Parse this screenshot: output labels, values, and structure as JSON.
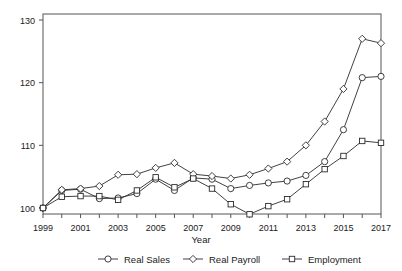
{
  "chart_data": {
    "type": "line",
    "title": "",
    "xlabel": "Year",
    "ylabel": "",
    "x": [
      1999,
      2000,
      2001,
      2002,
      2003,
      2004,
      2005,
      2006,
      2007,
      2008,
      2009,
      2010,
      2011,
      2012,
      2013,
      2014,
      2015,
      2016,
      2017
    ],
    "xlim": [
      1999,
      2017
    ],
    "ylim": [
      97,
      131
    ],
    "yticks": [
      100,
      110,
      120,
      130
    ],
    "xticks": [
      1999,
      2000,
      2001,
      2002,
      2003,
      2004,
      2005,
      2006,
      2007,
      2008,
      2009,
      2010,
      2011,
      2012,
      2013,
      2014,
      2015,
      2016,
      2017
    ],
    "xticklabels_shown": [
      "1999",
      "2001",
      "2003",
      "2005",
      "2007",
      "2009",
      "2011",
      "2013",
      "2015",
      "2017"
    ],
    "grid": false,
    "legend_position": "bottom",
    "series": [
      {
        "name": "Real Sales",
        "marker": "circle",
        "values": [
          100.0,
          102.8,
          103.0,
          101.5,
          101.6,
          102.3,
          104.6,
          102.8,
          104.8,
          104.6,
          103.1,
          103.6,
          104.0,
          104.3,
          105.2,
          107.4,
          112.5,
          120.8,
          121.0
        ]
      },
      {
        "name": "Real Payroll",
        "marker": "diamond",
        "values": [
          100.0,
          102.9,
          103.1,
          103.5,
          105.3,
          105.4,
          106.4,
          107.2,
          105.4,
          105.1,
          104.7,
          105.3,
          106.3,
          107.4,
          110.0,
          113.8,
          119.0,
          127.0,
          126.3
        ]
      },
      {
        "name": "Employment",
        "marker": "square",
        "values": [
          100.0,
          101.8,
          101.9,
          101.9,
          101.3,
          102.8,
          104.9,
          103.3,
          104.7,
          103.1,
          100.6,
          99.0,
          100.3,
          101.4,
          103.8,
          106.2,
          108.3,
          110.7,
          110.4
        ]
      }
    ]
  },
  "axes": {
    "x_title": "Year",
    "y_tick_labels": [
      "130",
      "120",
      "110",
      "100"
    ]
  },
  "legend": {
    "items": [
      {
        "label": "Real Sales",
        "marker": "circle"
      },
      {
        "label": "Real Payroll",
        "marker": "diamond"
      },
      {
        "label": "Employment",
        "marker": "square"
      }
    ]
  },
  "colors": {
    "line": "#2b2b2b",
    "axis": "#555555",
    "marker_fill": "#ffffff",
    "background": "#ffffff"
  }
}
